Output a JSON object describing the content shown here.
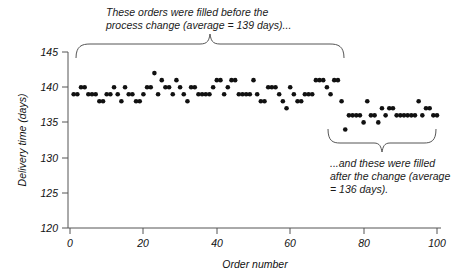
{
  "chart_data": {
    "type": "scatter",
    "title": "",
    "xlabel": "Order number",
    "ylabel": "Delivery time (days)",
    "xlim": [
      0,
      102
    ],
    "ylim": [
      120,
      145
    ],
    "xticks": [
      0,
      20,
      40,
      60,
      80,
      100
    ],
    "yticks": [
      120,
      125,
      130,
      135,
      140,
      145
    ],
    "grid": false,
    "legend": "none",
    "series": [
      {
        "name": "before-process-change",
        "average": 139,
        "x_range": [
          1,
          74
        ],
        "x": [
          1,
          2,
          3,
          4,
          5,
          6,
          7,
          8,
          9,
          10,
          11,
          12,
          13,
          14,
          15,
          16,
          17,
          18,
          19,
          20,
          21,
          22,
          23,
          24,
          25,
          26,
          27,
          28,
          29,
          30,
          31,
          32,
          33,
          34,
          35,
          36,
          37,
          38,
          39,
          40,
          41,
          42,
          43,
          44,
          45,
          46,
          47,
          48,
          49,
          50,
          51,
          52,
          53,
          54,
          55,
          56,
          57,
          58,
          59,
          60,
          61,
          62,
          63,
          64,
          65,
          66,
          67,
          68,
          69,
          70,
          71,
          72,
          73,
          74
        ],
        "y": [
          139,
          139,
          140,
          140,
          139,
          139,
          139,
          138,
          138,
          139,
          139,
          140,
          139,
          138,
          140,
          139,
          139,
          138,
          138,
          139,
          140,
          140,
          142,
          139,
          141,
          140,
          140,
          139,
          141,
          140,
          139,
          138,
          140,
          140,
          139,
          139,
          139,
          139,
          140,
          141,
          141,
          139,
          140,
          141,
          141,
          139,
          139,
          139,
          139,
          141,
          139,
          138,
          138,
          140,
          140,
          140,
          139,
          138,
          137,
          140,
          139,
          138,
          138,
          139,
          139,
          139,
          141,
          141,
          141,
          140,
          139,
          141,
          141,
          138
        ]
      },
      {
        "name": "after-process-change",
        "average": 136,
        "x_range": [
          75,
          100
        ],
        "x": [
          75,
          76,
          77,
          78,
          79,
          80,
          81,
          82,
          83,
          84,
          85,
          86,
          87,
          88,
          89,
          90,
          91,
          92,
          93,
          94,
          95,
          96,
          97,
          98,
          99,
          100
        ],
        "y": [
          134,
          136,
          136,
          136,
          136,
          135,
          138,
          136,
          136,
          135,
          137,
          136,
          137,
          137,
          136,
          136,
          136,
          136,
          136,
          136,
          138,
          136,
          137,
          137,
          136,
          136
        ]
      }
    ],
    "annotations": [
      {
        "id": "before-note",
        "text": "These orders were filled before the\nprocess change (average = 139 days)...",
        "brace": "up",
        "brace_x_range": [
          1,
          74
        ]
      },
      {
        "id": "after-note",
        "text": "...and these were filled\nafter the change (average\n= 136 days).",
        "brace": "down",
        "brace_x_range": [
          75,
          100
        ]
      }
    ],
    "colors": {
      "marker": "#111111",
      "axis": "#555555",
      "text": "#1a1a1a",
      "brace": "#555555",
      "background": "#ffffff"
    }
  }
}
